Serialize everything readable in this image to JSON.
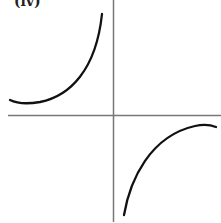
{
  "figure": {
    "label": "(iv)",
    "colors": {
      "curve": "#111111",
      "axis": "#777777",
      "background": "#ffffff"
    }
  }
}
